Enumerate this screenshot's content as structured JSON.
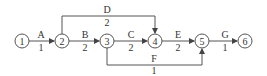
{
  "diagram": {
    "type": "activity-on-arrow network",
    "nodes": [
      {
        "id": "1",
        "label": "1",
        "x": 22,
        "y": 41
      },
      {
        "id": "2",
        "label": "2",
        "x": 62,
        "y": 41
      },
      {
        "id": "3",
        "label": "3",
        "x": 107,
        "y": 41
      },
      {
        "id": "4",
        "label": "4",
        "x": 155,
        "y": 41
      },
      {
        "id": "5",
        "label": "5",
        "x": 202,
        "y": 41
      },
      {
        "id": "6",
        "label": "6",
        "x": 245,
        "y": 41
      }
    ],
    "activities": [
      {
        "name": "A",
        "duration": "1",
        "from": "1",
        "to": "2"
      },
      {
        "name": "B",
        "duration": "2",
        "from": "2",
        "to": "3"
      },
      {
        "name": "C",
        "duration": "2",
        "from": "3",
        "to": "4"
      },
      {
        "name": "D",
        "duration": "2",
        "from": "2",
        "to": "4"
      },
      {
        "name": "E",
        "duration": "2",
        "from": "4",
        "to": "5"
      },
      {
        "name": "F",
        "duration": "1",
        "from": "3",
        "to": "5"
      },
      {
        "name": "G",
        "duration": "1",
        "from": "5",
        "to": "6"
      }
    ],
    "colors": {
      "line": "#444444",
      "text": "#333333",
      "background": "#ffffff"
    }
  }
}
